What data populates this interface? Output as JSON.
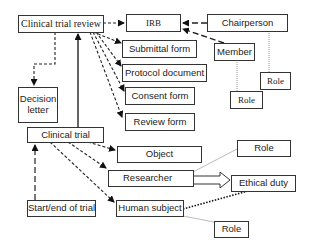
{
  "diagram": {
    "nodes": {
      "clinical_trial_review": "Clinical trial review",
      "irb": "IRB",
      "chairperson": "Chairperson",
      "member": "Member",
      "role_chair": "Role",
      "role_member": "Role",
      "submittal_form": "Submittal form",
      "protocol_document": "Protocol document",
      "consent_form": "Consent form",
      "review_form": "Review form",
      "decision_letter": "Decision letter",
      "clinical_trial": "Clinical trial",
      "object": "Object",
      "researcher": "Researcher",
      "role_researcher": "Role",
      "ethical_duty": "Ethical duty",
      "start_end_of_trial": "Start/end of trial",
      "human_subject": "Human subject",
      "role_human_subject": "Role"
    },
    "edges": [
      {
        "from": "Clinical trial review",
        "to": "IRB",
        "style": "dashed-arrow"
      },
      {
        "from": "Clinical trial review",
        "to": "Submittal form",
        "style": "dashed-arrow"
      },
      {
        "from": "Clinical trial review",
        "to": "Protocol document",
        "style": "dashed-arrow"
      },
      {
        "from": "Clinical trial review",
        "to": "Consent form",
        "style": "dashed-arrow"
      },
      {
        "from": "Clinical trial review",
        "to": "Review form",
        "style": "dashed-arrow"
      },
      {
        "from": "Clinical trial review",
        "to": "Decision letter",
        "style": "dashed-arrow"
      },
      {
        "from": "Chairperson",
        "to": "IRB",
        "style": "long-dashed-arrow"
      },
      {
        "from": "Member",
        "to": "IRB",
        "style": "long-dashed-arrow"
      },
      {
        "from": "Chairperson",
        "to": "Role",
        "style": "dotted-line"
      },
      {
        "from": "Member",
        "to": "Role",
        "style": "dotted-line"
      },
      {
        "from": "Clinical trial",
        "to": "Clinical trial review",
        "style": "solid-arrow"
      },
      {
        "from": "Clinical trial",
        "to": "Object",
        "style": "dashed-arrow"
      },
      {
        "from": "Clinical trial",
        "to": "Researcher",
        "style": "dashed-arrow"
      },
      {
        "from": "Clinical trial",
        "to": "Human subject",
        "style": "dashed-arrow"
      },
      {
        "from": "Start/end of trial",
        "to": "Clinical trial",
        "style": "long-dashed-arrow"
      },
      {
        "from": "Researcher",
        "to": "Ethical duty",
        "style": "hollow-double-arrow"
      },
      {
        "from": "Researcher",
        "to": "Role",
        "style": "thin-line"
      },
      {
        "from": "Human subject",
        "to": "Ethical duty",
        "style": "heavy-dotted-line"
      },
      {
        "from": "Human subject",
        "to": "Role",
        "style": "thin-line"
      }
    ]
  }
}
